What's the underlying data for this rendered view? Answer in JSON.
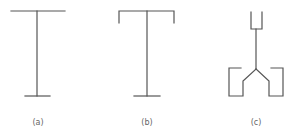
{
  "figure": {
    "panels": [
      {
        "id": "a",
        "label": "(a)",
        "description": "I-shaped symbol: wide top bar, vertical stem, short bottom bar"
      },
      {
        "id": "b",
        "label": "(b)",
        "description": "T-shaped symbol with downturned ends on top bar, vertical stem, short bottom bar"
      },
      {
        "id": "c",
        "label": "(c)",
        "description": "Y-shaped symbol: cup at top, stem splitting into two branches ending in bracket shapes"
      }
    ],
    "line_color": "#555555",
    "label_color": "#666666"
  }
}
